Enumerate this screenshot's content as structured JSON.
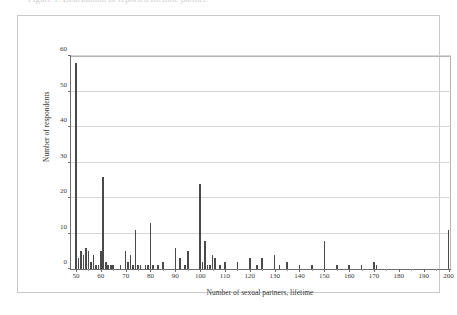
{
  "figure": {
    "caption_sliver_text": "Figure 1. Distribution of reported lifetime partners",
    "frame_color": "#c9c9c9"
  },
  "chart_data": {
    "type": "bar",
    "title": "",
    "xlabel": "Number of sexual partners, lifetime",
    "ylabel": "Number of respondents",
    "xlim": [
      48,
      201
    ],
    "ylim": [
      0,
      60
    ],
    "xticks": [
      50,
      60,
      70,
      80,
      90,
      100,
      110,
      120,
      130,
      140,
      150,
      160,
      170,
      180,
      190,
      200
    ],
    "yticks": [
      0,
      10,
      20,
      30,
      40,
      50,
      60
    ],
    "grid": "horizontal",
    "legend": "none",
    "bar_color": "#4a4a4a",
    "x": [
      50,
      51,
      52,
      53,
      54,
      55,
      56,
      57,
      58,
      59,
      60,
      61,
      62,
      63,
      64,
      65,
      66,
      67,
      68,
      69,
      70,
      71,
      72,
      73,
      74,
      75,
      76,
      77,
      78,
      79,
      80,
      81,
      82,
      83,
      84,
      85,
      86,
      87,
      88,
      89,
      90,
      91,
      92,
      93,
      94,
      95,
      96,
      97,
      98,
      99,
      100,
      101,
      102,
      103,
      104,
      105,
      106,
      107,
      108,
      109,
      110,
      111,
      112,
      113,
      114,
      115,
      116,
      117,
      118,
      119,
      120,
      121,
      122,
      123,
      124,
      125,
      126,
      127,
      128,
      129,
      130,
      131,
      132,
      133,
      134,
      135,
      136,
      137,
      138,
      139,
      140,
      141,
      142,
      143,
      144,
      145,
      146,
      147,
      148,
      149,
      150,
      151,
      152,
      153,
      154,
      155,
      156,
      157,
      158,
      159,
      160,
      161,
      162,
      163,
      164,
      165,
      166,
      167,
      168,
      169,
      170,
      171,
      172,
      173,
      174,
      175,
      176,
      177,
      178,
      179,
      180,
      181,
      182,
      183,
      184,
      185,
      186,
      187,
      188,
      189,
      190,
      191,
      192,
      193,
      194,
      195,
      196,
      197,
      198,
      199,
      200
    ],
    "values": [
      58,
      3,
      5,
      4,
      6,
      5,
      2,
      4,
      1,
      1,
      5,
      26,
      2,
      1,
      1,
      1,
      0,
      0,
      1,
      0,
      5,
      2,
      4,
      1,
      11,
      1,
      1,
      0,
      1,
      1,
      13,
      1,
      0,
      1,
      0,
      2,
      0,
      0,
      0,
      0,
      6,
      0,
      3,
      0,
      1,
      5,
      0,
      0,
      0,
      0,
      24,
      2,
      8,
      1,
      1,
      4,
      3,
      0,
      1,
      0,
      2,
      0,
      0,
      0,
      0,
      2,
      0,
      0,
      0,
      0,
      3,
      0,
      0,
      1,
      0,
      3,
      0,
      0,
      0,
      0,
      4,
      0,
      1,
      0,
      0,
      2,
      0,
      0,
      0,
      0,
      1,
      0,
      0,
      0,
      0,
      1,
      0,
      0,
      0,
      0,
      8,
      0,
      0,
      0,
      0,
      1,
      0,
      0,
      0,
      0,
      1,
      0,
      0,
      0,
      0,
      1,
      0,
      0,
      0,
      0,
      2,
      1,
      0,
      0,
      0,
      0,
      0,
      0,
      0,
      0,
      0,
      0,
      0,
      0,
      0,
      0,
      0,
      0,
      0,
      0,
      0,
      0,
      0,
      0,
      0,
      0,
      0,
      0,
      0,
      0,
      11
    ]
  }
}
